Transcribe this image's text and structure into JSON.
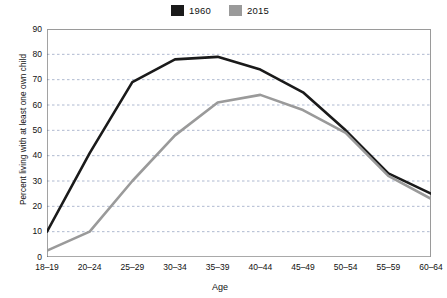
{
  "chart_data": {
    "type": "line",
    "title": "",
    "subtitle": "",
    "xlabel": "Age",
    "ylabel": "Percent living with at least one own child",
    "categories": [
      "18–19",
      "20–24",
      "25–29",
      "30–34",
      "35–39",
      "40–44",
      "45–49",
      "50–54",
      "55–59",
      "60–64"
    ],
    "series": [
      {
        "name": "1960",
        "color": "#1a1a1a",
        "values": [
          10,
          41,
          69,
          78,
          79,
          74,
          65,
          50,
          33,
          25
        ]
      },
      {
        "name": "2015",
        "color": "#9a9a9a",
        "values": [
          2.5,
          10,
          30,
          48,
          61,
          64,
          58,
          49,
          32,
          23
        ]
      }
    ],
    "ylim": [
      0,
      90
    ],
    "yticks": [
      0,
      10,
      20,
      30,
      40,
      50,
      60,
      70,
      80,
      90
    ],
    "ytick_labels": [
      "0",
      "10",
      "20",
      "30",
      "40",
      "50",
      "60",
      "70",
      "80",
      "90"
    ],
    "grid": "horizontal-dashed",
    "legend_position": "top-center",
    "axis_color": "#555555",
    "grid_color": "#9aa7c4",
    "background": "#ffffff"
  },
  "legend": {
    "entries": [
      {
        "label": "1960",
        "color": "#1a1a1a"
      },
      {
        "label": "2015",
        "color": "#9a9a9a"
      }
    ]
  }
}
